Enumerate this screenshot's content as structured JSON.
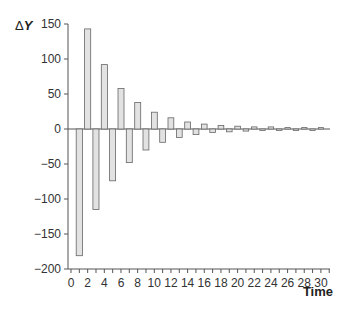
{
  "chart_data": {
    "type": "bar",
    "title": "",
    "xlabel": "Time",
    "ylabel": "ΔY",
    "ylim": [
      -200,
      150
    ],
    "xlim": [
      0,
      31
    ],
    "grid": false,
    "legend": null,
    "x_ticks": [
      0,
      2,
      4,
      6,
      8,
      10,
      12,
      14,
      16,
      18,
      20,
      22,
      24,
      26,
      28,
      30
    ],
    "y_ticks": [
      150,
      100,
      50,
      0,
      -50,
      -100,
      -150,
      -200
    ],
    "x_tick_labels": [
      "0",
      "2",
      "4",
      "6",
      "8",
      "10",
      "12",
      "14",
      "16",
      "18",
      "20",
      "22",
      "24",
      "26",
      "28",
      "30"
    ],
    "y_tick_labels": [
      "150",
      "100",
      "50",
      "0",
      "−50",
      "−100",
      "−150",
      "−200"
    ],
    "x": [
      1,
      2,
      3,
      4,
      5,
      6,
      7,
      8,
      9,
      10,
      11,
      12,
      13,
      14,
      15,
      16,
      17,
      18,
      19,
      20,
      21,
      22,
      23,
      24,
      25,
      26,
      27,
      28,
      29,
      30
    ],
    "values": [
      -181,
      143,
      -115,
      92,
      -74,
      58,
      -48,
      38,
      -30,
      24,
      -19,
      16,
      -12,
      10,
      -8,
      7,
      -5,
      5,
      -4,
      4,
      -3,
      3,
      -2,
      3,
      -2,
      2,
      -2,
      2,
      -2,
      2
    ],
    "bar_fill": "#e2e2e2",
    "bar_stroke": "#666666"
  },
  "axes": {
    "ylabel_delta": "Δ",
    "ylabel_var": "Y",
    "xlabel": "Time"
  }
}
